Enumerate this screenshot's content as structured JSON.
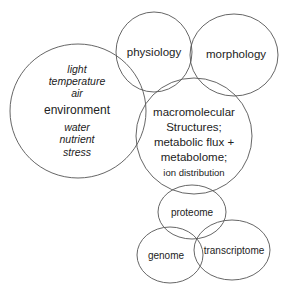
{
  "diagram": {
    "title": "",
    "colors": {
      "stroke": "#555555",
      "text": "#222222",
      "background": "#ffffff"
    },
    "nodes": {
      "environment": {
        "label": "environment",
        "factors_top": [
          "light",
          "temperature",
          "air"
        ],
        "factors_bottom": [
          "water",
          "nutrient",
          "stress"
        ]
      },
      "physiology": {
        "label": "physiology"
      },
      "morphology": {
        "label": "morphology"
      },
      "macromolecular": {
        "lines": [
          "macromolecular",
          "Structures;",
          "metabolic flux +",
          "metabolome;"
        ],
        "sub": "ion distribution"
      },
      "proteome": {
        "label": "proteome"
      },
      "genome": {
        "label": "genome"
      },
      "transcriptome": {
        "label": "transcriptome"
      }
    }
  }
}
